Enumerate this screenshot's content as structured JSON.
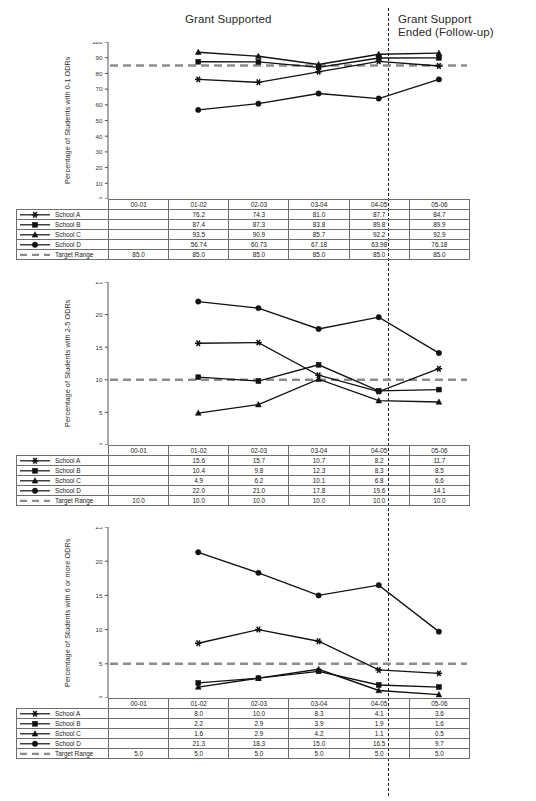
{
  "banners": {
    "grant_supported": "Grant Supported",
    "grant_ended": "Grant Support\nEnded  (Follow-up)"
  },
  "years": [
    "00-01",
    "01-02",
    "02-03",
    "03-04",
    "04-05",
    "05-06"
  ],
  "series_names": [
    "School A",
    "School B",
    "School C",
    "School D",
    "Target Range"
  ],
  "markers": {
    "School A": "asterisk-marker",
    "School B": "square-marker",
    "School C": "triangle-marker",
    "School D": "circle-marker",
    "Target Range": "dashed-line-marker"
  },
  "colors": {
    "line": "#111111",
    "target": "#8c8c8c",
    "grid_border": "#6e6e6e",
    "axis": "#555555"
  },
  "chart_data": [
    {
      "type": "line",
      "id": "chart-0-1-odrs",
      "title": "",
      "ylabel": "Percentage of Students with 0-1 ODRs",
      "xlabel": "",
      "ylim": [
        0,
        100
      ],
      "yticks": [
        0,
        10,
        20,
        30,
        40,
        50,
        60,
        70,
        80,
        90,
        100
      ],
      "grid": false,
      "legend_position": "table-below",
      "categories": [
        "00-01",
        "01-02",
        "02-03",
        "03-04",
        "04-05",
        "05-06"
      ],
      "series": [
        {
          "name": "School A",
          "values": [
            null,
            76.2,
            74.3,
            81.0,
            87.7,
            84.7
          ],
          "labels": [
            "",
            "76.2",
            "74.3",
            "81.0",
            "87.7",
            "84.7"
          ]
        },
        {
          "name": "School B",
          "values": [
            null,
            87.4,
            87.3,
            83.8,
            89.8,
            89.9
          ],
          "labels": [
            "",
            "87.4",
            "87.3",
            "83.8",
            "89.8",
            "89.9"
          ]
        },
        {
          "name": "School C",
          "values": [
            null,
            93.5,
            90.9,
            85.7,
            92.2,
            92.9
          ],
          "labels": [
            "",
            "93.5",
            "90.9",
            "85.7",
            "92.2",
            "92.9"
          ]
        },
        {
          "name": "School D",
          "values": [
            null,
            56.74,
            60.73,
            67.18,
            63.98,
            76.18
          ],
          "labels": [
            "",
            "56.74",
            "60.73",
            "67.18",
            "63.98",
            "76.18"
          ]
        },
        {
          "name": "Target Range",
          "values": [
            85.0,
            85.0,
            85.0,
            85.0,
            85.0,
            85.0
          ],
          "labels": [
            "85.0",
            "85.0",
            "85.0",
            "85.0",
            "85.0",
            "85.0"
          ]
        }
      ]
    },
    {
      "type": "line",
      "id": "chart-2-5-odrs",
      "title": "",
      "ylabel": "Percentage of Students with 2-5 ODRs",
      "xlabel": "",
      "ylim": [
        0,
        25
      ],
      "yticks": [
        0,
        5,
        10,
        15,
        20,
        25
      ],
      "grid": false,
      "legend_position": "table-below",
      "categories": [
        "00-01",
        "01-02",
        "02-03",
        "03-04",
        "04-05",
        "05-06"
      ],
      "series": [
        {
          "name": "School A",
          "values": [
            null,
            15.6,
            15.7,
            10.7,
            8.2,
            11.7
          ],
          "labels": [
            "",
            "15.6",
            "15.7",
            "10.7",
            "8.2",
            "11.7"
          ]
        },
        {
          "name": "School B",
          "values": [
            null,
            10.4,
            9.8,
            12.3,
            8.3,
            8.5
          ],
          "labels": [
            "",
            "10.4",
            "9.8",
            "12.3",
            "8.3",
            "8.5"
          ]
        },
        {
          "name": "School C",
          "values": [
            null,
            4.9,
            6.2,
            10.1,
            6.8,
            6.6
          ],
          "labels": [
            "",
            "4.9",
            "6.2",
            "10.1",
            "6.8",
            "6.6"
          ]
        },
        {
          "name": "School D",
          "values": [
            null,
            22.0,
            21.0,
            17.8,
            19.6,
            14.1
          ],
          "labels": [
            "",
            "22.0",
            "21.0",
            "17.8",
            "19.6",
            "14.1"
          ]
        },
        {
          "name": "Target Range",
          "values": [
            10.0,
            10.0,
            10.0,
            10.0,
            10.0,
            10.0
          ],
          "labels": [
            "10.0",
            "10.0",
            "10.0",
            "10.0",
            "10.0",
            "10.0"
          ]
        }
      ]
    },
    {
      "type": "line",
      "id": "chart-6-or-more-odrs",
      "title": "",
      "ylabel": "Percentage of Students with 6 or more ODRs",
      "xlabel": "",
      "ylim": [
        0,
        25
      ],
      "yticks": [
        0,
        5,
        10,
        15,
        20,
        25
      ],
      "grid": false,
      "legend_position": "table-below",
      "categories": [
        "00-01",
        "01-02",
        "02-03",
        "03-04",
        "04-05",
        "05-06"
      ],
      "series": [
        {
          "name": "School A",
          "values": [
            null,
            8.0,
            10.0,
            8.3,
            4.1,
            3.6
          ],
          "labels": [
            "",
            "8.0",
            "10.0",
            "8.3",
            "4.1",
            "3.6"
          ]
        },
        {
          "name": "School B",
          "values": [
            null,
            2.2,
            2.9,
            3.9,
            1.9,
            1.6
          ],
          "labels": [
            "",
            "2.2",
            "2.9",
            "3.9",
            "1.9",
            "1.6"
          ]
        },
        {
          "name": "School C",
          "values": [
            null,
            1.6,
            2.9,
            4.2,
            1.1,
            0.5
          ],
          "labels": [
            "",
            "1.6",
            "2.9",
            "4.2",
            "1.1",
            "0.5"
          ]
        },
        {
          "name": "School D",
          "values": [
            null,
            21.3,
            18.3,
            15.0,
            16.5,
            9.7
          ],
          "labels": [
            "",
            "21.3",
            "18.3",
            "15.0",
            "16.5",
            "9.7"
          ]
        },
        {
          "name": "Target Range",
          "values": [
            5.0,
            5.0,
            5.0,
            5.0,
            5.0,
            5.0
          ],
          "labels": [
            "5.0",
            "5.0",
            "5.0",
            "5.0",
            "5.0",
            "5.0"
          ]
        }
      ]
    }
  ]
}
